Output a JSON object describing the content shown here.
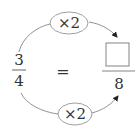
{
  "diagram": {
    "left_fraction": {
      "numerator": "3",
      "denominator": "4"
    },
    "equals_sign": "=",
    "right_fraction": {
      "numerator": "",
      "denominator": "8",
      "numerator_is_blank_box": true
    },
    "top_operation": {
      "label": "×2",
      "target": "numerator"
    },
    "bottom_operation": {
      "label": "×2",
      "target": "denominator"
    },
    "colors": {
      "stroke": "#555555",
      "text": "#333333",
      "box": "#777777"
    }
  }
}
